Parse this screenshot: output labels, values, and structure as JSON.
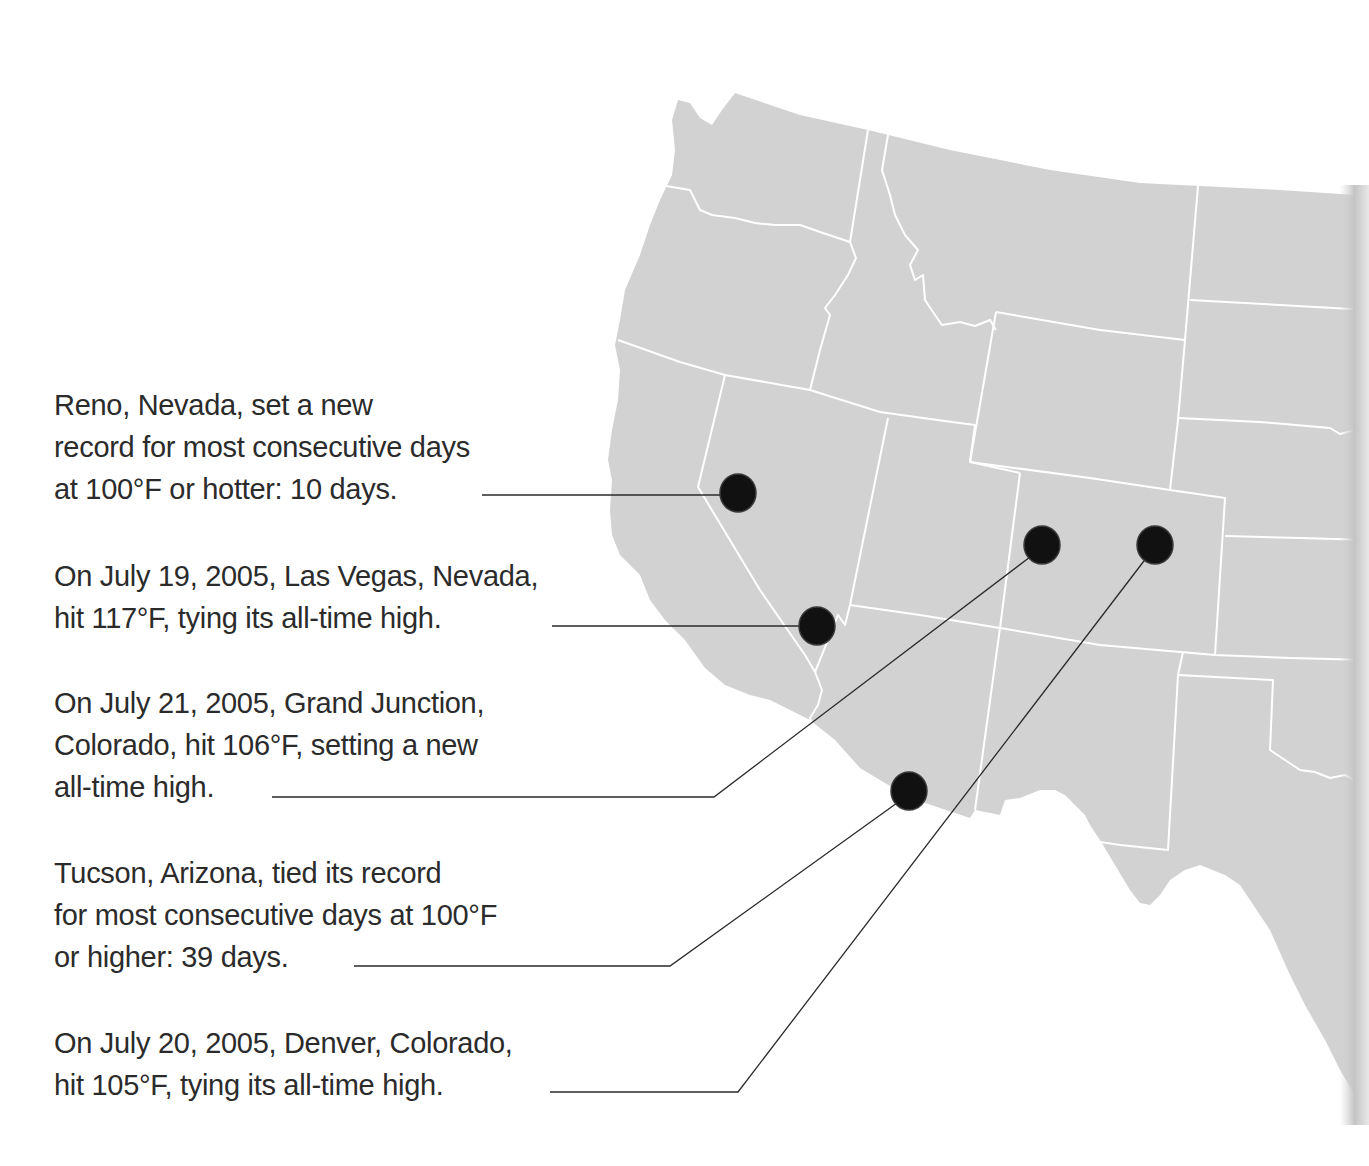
{
  "map": {
    "region": "Western United States",
    "land_color": "#d2d2d2",
    "border_color": "#ffffff",
    "marker_color": "#111111",
    "leader_color": "#2a2a2a"
  },
  "annotations": [
    {
      "id": "reno",
      "city": "Reno, Nevada",
      "lines": [
        "Reno, Nevada, set a new",
        "record for most consecutive days",
        "at 100°F or hotter: 10 days."
      ]
    },
    {
      "id": "las-vegas",
      "city": "Las Vegas, Nevada",
      "lines": [
        "On July 19, 2005, Las Vegas, Nevada,",
        "hit 117°F, tying its all-time high."
      ]
    },
    {
      "id": "grand-junction",
      "city": "Grand Junction, Colorado",
      "lines": [
        "On July 21, 2005, Grand Junction,",
        "Colorado, hit 106°F, setting a new",
        "all-time high."
      ]
    },
    {
      "id": "tucson",
      "city": "Tucson, Arizona",
      "lines": [
        "Tucson, Arizona, tied its record",
        "for most consecutive days at 100°F",
        "or higher: 39 days."
      ]
    },
    {
      "id": "denver",
      "city": "Denver, Colorado",
      "lines": [
        "On July 20, 2005, Denver, Colorado,",
        "hit 105°F, tying its all-time high."
      ]
    }
  ]
}
